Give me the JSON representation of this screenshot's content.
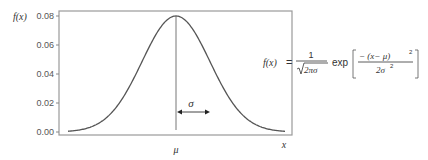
{
  "chart_data": {
    "type": "line",
    "xlabel": "x",
    "ylabel": "f(x)",
    "y_ticks": [
      "0.00",
      "0.02",
      "0.04",
      "0.06",
      "0.08"
    ],
    "ylim": [
      0,
      0.08
    ],
    "x_ticks": [
      "μ"
    ],
    "grid": false,
    "legend": null,
    "series": [
      {
        "name": "f(x)",
        "shape": "gaussian",
        "mean_label": "μ",
        "peak_value": 0.08,
        "x_rel_sigma": [
          -4,
          -3,
          -2.5,
          -2,
          -1.5,
          -1,
          -0.5,
          0,
          0.5,
          1,
          1.5,
          2,
          2.5,
          3,
          4
        ],
        "values": [
          0.0003,
          0.0009,
          0.0035,
          0.0108,
          0.026,
          0.0485,
          0.0706,
          0.08,
          0.0706,
          0.0485,
          0.026,
          0.0108,
          0.0035,
          0.0009,
          0.0003
        ]
      }
    ],
    "annotations": [
      {
        "type": "vertical-line",
        "at": "μ",
        "label": "μ"
      },
      {
        "type": "double-arrow",
        "from": "μ",
        "to": "μ+σ",
        "label": "σ"
      }
    ],
    "formula": {
      "lhs": "f(x)",
      "equals": "=",
      "frac_num": "1",
      "frac_den": "√2πσ",
      "func": "exp",
      "exp_num": "− (x− μ)²",
      "exp_den": "2σ²"
    }
  },
  "labels": {
    "y_axis": "f(x)",
    "x_axis": "x",
    "mu": "μ",
    "sigma": "σ",
    "tick_000": "0.00",
    "tick_002": "0.02",
    "tick_004": "0.04",
    "tick_006": "0.06",
    "tick_008": "0.08"
  },
  "formula_text": {
    "lhs": "f(x)",
    "eq": "=",
    "num": "1",
    "sqrt_body": "2πσ",
    "exp": "exp",
    "top": "− (x− μ)",
    "top_sup": "2",
    "bot": "2σ",
    "bot_sup": "2"
  },
  "colors": {
    "curve": "#555555",
    "frame": "#9a9a9a",
    "text": "#333333"
  }
}
